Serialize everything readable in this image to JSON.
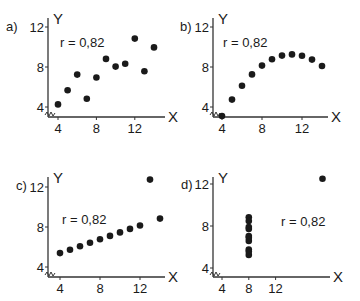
{
  "chart_data": [
    {
      "type": "scatter",
      "panel_label": "a)",
      "annotation": "r = 0,82",
      "xlabel": "X",
      "ylabel": "Y",
      "x_ticks": [
        4,
        8,
        12
      ],
      "y_ticks": [
        4,
        8,
        12
      ],
      "grid": false,
      "x": [
        10,
        8,
        13,
        9,
        11,
        14,
        6,
        4,
        12,
        7,
        5
      ],
      "y": [
        8.04,
        6.95,
        7.58,
        8.81,
        8.33,
        9.96,
        7.24,
        4.26,
        10.84,
        4.82,
        5.68
      ],
      "layout": {
        "ox": 48,
        "axisY": 117,
        "x0": 4,
        "px0": 58,
        "pxPerX": 9.6,
        "y0": 4,
        "py0": 107,
        "pxPerY": 10,
        "xEnd": 165,
        "yTop": 18,
        "labelX": 6,
        "labelY": 31,
        "annX": 60,
        "annY": 47,
        "xTickY": 133,
        "XLabelX": 168,
        "YLabelX": 53,
        "YLabelY": 24
      }
    },
    {
      "type": "scatter",
      "panel_label": "b)",
      "annotation": "r = 0,82",
      "xlabel": "X",
      "ylabel": "Y",
      "x_ticks": [
        4,
        8,
        12
      ],
      "y_ticks": [
        4,
        8,
        12
      ],
      "grid": false,
      "x": [
        10,
        8,
        13,
        9,
        11,
        14,
        6,
        4,
        12,
        7,
        5
      ],
      "y": [
        9.14,
        8.14,
        8.74,
        8.77,
        9.26,
        8.1,
        6.13,
        3.1,
        9.13,
        7.26,
        4.74
      ],
      "layout": {
        "ox": 213,
        "axisY": 117,
        "x0": 4,
        "px0": 222,
        "pxPerX": 10,
        "y0": 4,
        "py0": 107,
        "pxPerY": 10,
        "xEnd": 328,
        "yTop": 18,
        "labelX": 180,
        "labelY": 31,
        "annX": 223,
        "annY": 47,
        "xTickY": 133,
        "XLabelX": 331,
        "YLabelX": 218,
        "YLabelY": 24
      }
    },
    {
      "type": "scatter",
      "panel_label": "c)",
      "annotation": "r = 0,82",
      "xlabel": "X",
      "ylabel": "Y",
      "x_ticks": [
        4,
        8,
        12
      ],
      "y_ticks": [
        4,
        8,
        12
      ],
      "grid": false,
      "x": [
        10,
        8,
        13,
        9,
        11,
        14,
        6,
        4,
        12,
        7,
        5
      ],
      "y": [
        7.46,
        6.77,
        12.74,
        7.11,
        7.81,
        8.84,
        6.08,
        5.39,
        8.15,
        6.42,
        5.73
      ],
      "layout": {
        "ox": 48,
        "axisY": 277,
        "x0": 4,
        "px0": 60,
        "pxPerX": 10,
        "y0": 4,
        "py0": 267,
        "pxPerY": 10,
        "xEnd": 165,
        "yTop": 177,
        "labelX": 16,
        "labelY": 190,
        "annX": 62,
        "annY": 224,
        "xTickY": 293,
        "XLabelX": 168,
        "YLabelX": 53,
        "YLabelY": 183
      }
    },
    {
      "type": "scatter",
      "panel_label": "d)",
      "annotation": "r = 0,82",
      "xlabel": "X",
      "ylabel": "Y",
      "x_ticks": [
        4,
        8,
        12
      ],
      "y_ticks": [
        4,
        8,
        12
      ],
      "grid": false,
      "x": [
        8,
        8,
        8,
        8,
        8,
        8,
        8,
        19,
        8,
        8,
        8
      ],
      "y": [
        6.58,
        5.76,
        7.71,
        8.84,
        8.47,
        7.04,
        5.25,
        12.5,
        5.56,
        7.91,
        6.89
      ],
      "layout": {
        "ox": 213,
        "axisY": 277,
        "x0": 4,
        "px0": 222,
        "pxPerX": 6.7,
        "y0": 4,
        "py0": 268,
        "pxPerY": 10.5,
        "xEnd": 330,
        "yTop": 177,
        "labelX": 181,
        "labelY": 189,
        "annX": 281,
        "annY": 226,
        "xTickY": 293,
        "XLabelX": 333,
        "YLabelX": 218,
        "YLabelY": 183
      }
    }
  ]
}
